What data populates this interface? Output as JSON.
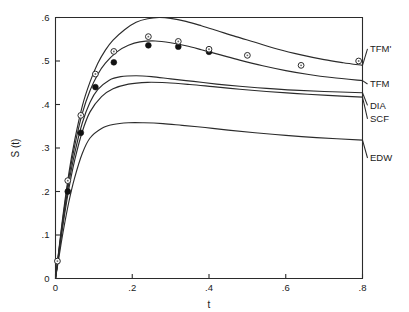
{
  "chart_data": {
    "type": "line",
    "title": "",
    "xlabel": "t",
    "ylabel": "S (t)",
    "xlim": [
      0,
      0.8
    ],
    "ylim": [
      0,
      0.6
    ],
    "xticks": [
      0,
      0.2,
      0.4,
      0.6,
      0.8
    ],
    "xticklabels": [
      "0",
      ".2",
      ".4",
      ".6",
      ".8"
    ],
    "yticks": [
      0,
      0.1,
      0.2,
      0.3,
      0.4,
      0.5,
      0.6
    ],
    "yticklabels": [
      "0",
      ".1",
      ".2",
      ".3",
      ".4",
      ".5",
      ".6"
    ],
    "grid": false,
    "legend_position": "right-inline-labels",
    "series": [
      {
        "name": "TFM'",
        "label": "TFM'",
        "label_y": 0.528,
        "x": [
          0.0,
          0.01,
          0.02,
          0.035,
          0.05,
          0.07,
          0.09,
          0.11,
          0.13,
          0.15,
          0.18,
          0.21,
          0.24,
          0.27,
          0.3,
          0.34,
          0.38,
          0.42,
          0.47,
          0.52,
          0.58,
          0.64,
          0.7,
          0.75,
          0.8
        ],
        "y": [
          0.0,
          0.075,
          0.148,
          0.243,
          0.318,
          0.397,
          0.452,
          0.494,
          0.525,
          0.548,
          0.572,
          0.589,
          0.597,
          0.6,
          0.598,
          0.591,
          0.581,
          0.57,
          0.556,
          0.543,
          0.527,
          0.514,
          0.503,
          0.496,
          0.49
        ]
      },
      {
        "name": "TFM",
        "label": "TFM",
        "label_y": 0.447,
        "x": [
          0.0,
          0.01,
          0.02,
          0.035,
          0.05,
          0.07,
          0.09,
          0.11,
          0.13,
          0.16,
          0.19,
          0.22,
          0.26,
          0.3,
          0.34,
          0.38,
          0.43,
          0.48,
          0.54,
          0.6,
          0.66,
          0.72,
          0.8
        ],
        "y": [
          0.0,
          0.072,
          0.142,
          0.233,
          0.305,
          0.38,
          0.432,
          0.469,
          0.495,
          0.521,
          0.536,
          0.544,
          0.546,
          0.542,
          0.535,
          0.526,
          0.514,
          0.502,
          0.489,
          0.478,
          0.469,
          0.462,
          0.455
        ]
      },
      {
        "name": "DIA",
        "label": "DIA",
        "label_y": 0.398,
        "x": [
          0.0,
          0.01,
          0.02,
          0.035,
          0.05,
          0.07,
          0.09,
          0.11,
          0.14,
          0.17,
          0.21,
          0.25,
          0.3,
          0.36,
          0.42,
          0.48,
          0.55,
          0.62,
          0.7,
          0.8
        ],
        "y": [
          0.0,
          0.068,
          0.134,
          0.22,
          0.288,
          0.358,
          0.405,
          0.434,
          0.456,
          0.464,
          0.466,
          0.464,
          0.459,
          0.453,
          0.447,
          0.442,
          0.437,
          0.433,
          0.43,
          0.427
        ]
      },
      {
        "name": "SCF",
        "label": "SCF",
        "label_y": 0.367,
        "x": [
          0.0,
          0.01,
          0.02,
          0.035,
          0.05,
          0.07,
          0.09,
          0.12,
          0.15,
          0.19,
          0.24,
          0.29,
          0.35,
          0.41,
          0.48,
          0.55,
          0.63,
          0.71,
          0.8
        ],
        "y": [
          0.0,
          0.064,
          0.126,
          0.207,
          0.272,
          0.338,
          0.383,
          0.418,
          0.436,
          0.447,
          0.451,
          0.45,
          0.446,
          0.441,
          0.435,
          0.43,
          0.425,
          0.421,
          0.417
        ]
      },
      {
        "name": "EDW",
        "label": "EDW",
        "label_y": 0.277,
        "x": [
          0.0,
          0.01,
          0.02,
          0.035,
          0.05,
          0.07,
          0.09,
          0.12,
          0.15,
          0.19,
          0.23,
          0.28,
          0.33,
          0.39,
          0.45,
          0.52,
          0.6,
          0.68,
          0.8
        ],
        "y": [
          0.0,
          0.055,
          0.108,
          0.177,
          0.232,
          0.288,
          0.323,
          0.345,
          0.354,
          0.358,
          0.358,
          0.356,
          0.352,
          0.347,
          0.341,
          0.335,
          0.329,
          0.324,
          0.318
        ]
      }
    ],
    "points_open": {
      "name": "open-circle-data",
      "x": [
        0.005,
        0.032,
        0.066,
        0.104,
        0.152,
        0.242,
        0.32,
        0.4,
        0.5,
        0.64,
        0.79
      ],
      "y": [
        0.04,
        0.225,
        0.375,
        0.47,
        0.522,
        0.556,
        0.545,
        0.527,
        0.513,
        0.49,
        0.5
      ]
    },
    "points_filled": {
      "name": "filled-circle-data",
      "x": [
        0.032,
        0.066,
        0.104,
        0.152,
        0.242,
        0.32,
        0.4
      ],
      "y": [
        0.2,
        0.335,
        0.44,
        0.497,
        0.536,
        0.533,
        0.521
      ]
    }
  }
}
